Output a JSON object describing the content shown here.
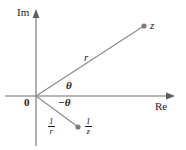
{
  "figure": {
    "colors": {
      "axis": "#6e6e6e",
      "ray": "#8a8a8a",
      "point": "#808080",
      "text": "#1c1c1c",
      "background": "#ffffff"
    },
    "axes": {
      "imaginary_label": "Im",
      "real_label": "Re",
      "origin_label": "0",
      "origin_px": {
        "x": 36,
        "y": 96
      },
      "im_axis": {
        "x": 36,
        "y_top": 10,
        "y_bottom": 146
      },
      "re_axis": {
        "y": 96,
        "x_left": 5,
        "x_right": 174
      }
    },
    "points": [
      {
        "name": "z",
        "label": "z",
        "px": {
          "x": 144,
          "y": 26
        },
        "label_px": {
          "x": 150,
          "y": 21
        }
      },
      {
        "name": "one-over-z",
        "label_numerator": "1",
        "label_denominator": "z",
        "px": {
          "x": 78,
          "y": 127
        },
        "label_px": {
          "x": 86,
          "y": 118
        }
      }
    ],
    "rays": [
      {
        "name": "r-ray",
        "from": {
          "x": 36,
          "y": 96
        },
        "to": {
          "x": 144,
          "y": 26
        },
        "label": "r",
        "label_px": {
          "x": 84,
          "y": 53
        }
      },
      {
        "name": "one-over-r-ray",
        "from": {
          "x": 36,
          "y": 96
        },
        "to": {
          "x": 78,
          "y": 127
        },
        "label_numerator": "1",
        "label_denominator": "r",
        "label_px": {
          "x": 50,
          "y": 118
        }
      }
    ],
    "angles": [
      {
        "name": "theta-positive",
        "label": "θ",
        "label_px": {
          "x": 66,
          "y": 82
        }
      },
      {
        "name": "theta-negative",
        "label": "−θ",
        "label_px": {
          "x": 59,
          "y": 99
        }
      }
    ]
  }
}
